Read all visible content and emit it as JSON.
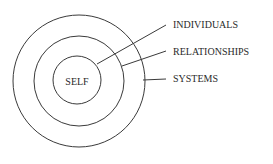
{
  "diagram": {
    "center_label": "SELF",
    "rings": [
      {
        "name": "self",
        "label": "SELF"
      },
      {
        "name": "relationships",
        "label": "RELATIONSHIPS"
      },
      {
        "name": "systems",
        "label": "SYSTEMS"
      }
    ],
    "callouts": [
      {
        "label": "INDIVIDUALS"
      },
      {
        "label": "RELATIONSHIPS"
      },
      {
        "label": "SYSTEMS"
      }
    ],
    "colors": {
      "stroke": "#3a3a3a",
      "text": "#2a2a2a",
      "background": "#ffffff"
    }
  }
}
